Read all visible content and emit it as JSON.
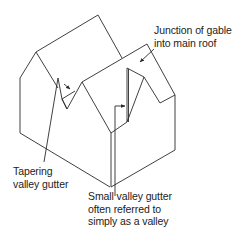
{
  "diagram": {
    "labels": {
      "junction": {
        "lines": [
          "Junction of gable",
          "into main roof"
        ]
      },
      "tapering": {
        "lines": [
          "Tapering",
          "valley gutter"
        ]
      },
      "small_valley": {
        "lines": [
          "Small valley gutter",
          "often referred to",
          "simply as a valley"
        ]
      }
    },
    "colors": {
      "line": "#2a2a2a",
      "text": "#222222",
      "background": "#ffffff"
    }
  }
}
